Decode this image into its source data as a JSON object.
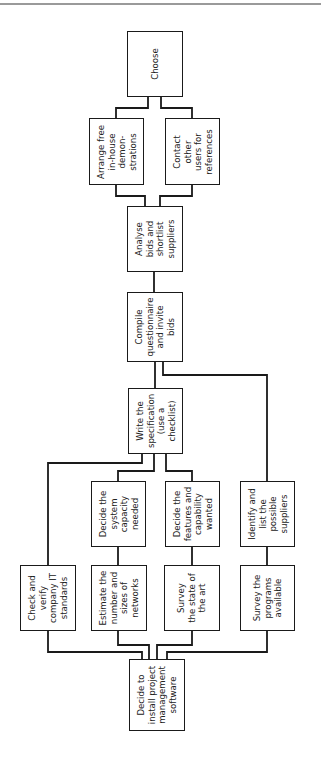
{
  "diagram": {
    "type": "flowchart",
    "orientation": "rotated-90",
    "nodes": {
      "choose": "Choose",
      "arrange": "Arrange free\nin-house\ndemon-\nstrations",
      "contact": "Contact\nother\nusers for\nreferences",
      "analyse": "Analyse\nbids and\nshortlist\nsuppliers",
      "compile": "Compile\nquestionnaire\nand invite\nbids",
      "write_spec": "Write the\nspecification\n(use a\nchecklist)",
      "decide_capacity": "Decide the\nsystem\ncapacity\nneeded",
      "decide_features": "Decide the\nfeatures and\ncapability\nwanted",
      "identify": "Identify and\nlist the\npossible\nsuppliers",
      "check": "Check and\nverify\ncompany IT\nstandards",
      "estimate": "Estimate the\nnumber and\nsizes of\nnetworks",
      "survey_art": "Survey\nthe state of\nthe art",
      "survey_programs": "Survey the\nprograms\navailable",
      "decide_install": "Decide to\ninstall project\nmanagement\nsoftware"
    },
    "edges": [
      [
        "decide_install",
        "check"
      ],
      [
        "decide_install",
        "estimate"
      ],
      [
        "decide_install",
        "survey_art"
      ],
      [
        "decide_install",
        "survey_programs"
      ],
      [
        "check",
        "write_spec"
      ],
      [
        "estimate",
        "decide_capacity"
      ],
      [
        "decide_capacity",
        "write_spec"
      ],
      [
        "survey_art",
        "decide_features"
      ],
      [
        "decide_features",
        "write_spec"
      ],
      [
        "survey_programs",
        "identify"
      ],
      [
        "identify",
        "compile"
      ],
      [
        "write_spec",
        "compile"
      ],
      [
        "compile",
        "analyse"
      ],
      [
        "analyse",
        "arrange"
      ],
      [
        "analyse",
        "contact"
      ],
      [
        "arrange",
        "choose"
      ],
      [
        "contact",
        "choose"
      ]
    ]
  }
}
